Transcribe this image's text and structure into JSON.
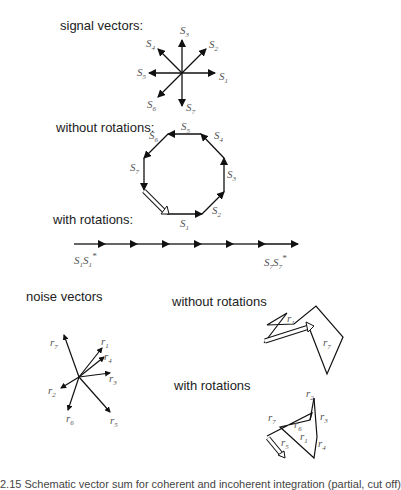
{
  "sections": {
    "signal": {
      "title": "signal vectors:",
      "labels": [
        "S1",
        "S2",
        "S3",
        "S4",
        "S5",
        "S6",
        "S7"
      ]
    },
    "without": {
      "title": "without rotations:",
      "labels": [
        "S1",
        "S2",
        "S3",
        "S4",
        "S5",
        "S6",
        "S7"
      ]
    },
    "with": {
      "title": "with rotations:",
      "left_label": "S1S1*",
      "right_label": "S7S7*"
    },
    "noise": {
      "title": "noise vectors",
      "labels": [
        "r1",
        "r2",
        "r3",
        "r4",
        "r5",
        "r6",
        "r7"
      ]
    },
    "noise_without": {
      "title": "without rotations",
      "labels": [
        "r1",
        "r7"
      ]
    },
    "noise_with": {
      "title": "with rotations",
      "labels": [
        "r1",
        "r2",
        "r3",
        "r4",
        "r5",
        "r6",
        "r7"
      ]
    }
  },
  "caption": "2.15 Schematic vector sum for coherent and incoherent integration (partial, cut off)"
}
